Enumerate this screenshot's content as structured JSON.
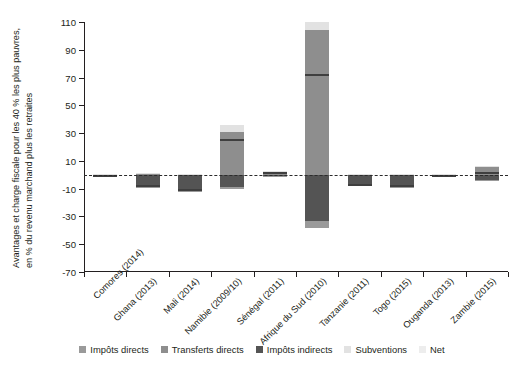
{
  "chart_data": {
    "type": "bar",
    "title": "",
    "subtitle": "",
    "xlabel": "",
    "ylabel": "Avantages et charge fiscale pour les 40 % les plus pauvres, en % du revenu marchand plus les retraites",
    "ylabel_line1": "Avantages et charge fiscale pour les 40 % les plus pauvres,",
    "ylabel_line2": "en % du revenu marchand plus les retraites",
    "ylim": [
      -70,
      110
    ],
    "yticks": [
      -70,
      -50,
      -30,
      -10,
      10,
      30,
      50,
      70,
      90,
      110
    ],
    "ytick_labels": [
      "-70",
      "-50",
      "-30",
      "-10",
      "10",
      "30",
      "50",
      "70",
      "90",
      "110"
    ],
    "grid": false,
    "zero_line": true,
    "legend_position": "bottom",
    "stacked": true,
    "categories": [
      "Comores (2014)",
      "Ghana (2013)",
      "Mali (2014)",
      "Namibie (2009/10)",
      "Sénégal (2011)",
      "Afrique du Sud (2010)",
      "Tanzanie (2011)",
      "Togo (2015)",
      "Ouganda (2013)",
      "Zambie (2015)"
    ],
    "series": [
      {
        "name": "Impôts directs",
        "color": "#9a9a9a",
        "values": [
          -0.4,
          -0.6,
          -0.3,
          -1.5,
          -0.3,
          -5.0,
          -0.5,
          -0.4,
          -0.2,
          -0.8
        ]
      },
      {
        "name": "Transferts directs",
        "color": "#8e8e8e",
        "values": [
          0.4,
          0.8,
          0.5,
          31.0,
          2.0,
          104.0,
          0.6,
          0.5,
          0.3,
          5.5
        ]
      },
      {
        "name": "Impôts indirects",
        "color": "#545454",
        "values": [
          -1.0,
          -8.5,
          -11.5,
          -9.0,
          -1.0,
          -33.0,
          -7.5,
          -8.5,
          -0.8,
          -4.0
        ]
      },
      {
        "name": "Subventions",
        "color": "#e2e2e2",
        "values": [
          0.2,
          0.3,
          0.2,
          4.5,
          0.6,
          6.0,
          0.2,
          0.2,
          0.1,
          0.5
        ]
      }
    ],
    "net": {
      "name": "Net",
      "color": "#3f3f3f",
      "values": [
        -0.8,
        -7.8,
        -11.0,
        25.0,
        1.3,
        72.0,
        -7.2,
        -8.2,
        -0.6,
        1.2
      ]
    },
    "legend": [
      {
        "label": "Impôts directs",
        "color": "#9a9a9a"
      },
      {
        "label": "Transferts directs",
        "color": "#8e8e8e"
      },
      {
        "label": "Impôts indirects",
        "color": "#545454"
      },
      {
        "label": "Subventions",
        "color": "#e2e2e2"
      },
      {
        "label": "Net",
        "color": "#ededed"
      }
    ]
  }
}
